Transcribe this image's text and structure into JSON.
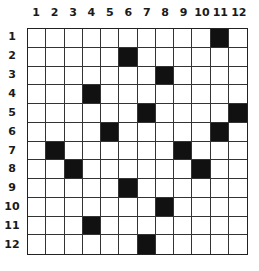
{
  "puzzle": {
    "columns": [
      "1",
      "2",
      "3",
      "4",
      "5",
      "6",
      "7",
      "8",
      "9",
      "10",
      "11",
      "12"
    ],
    "rows": [
      "1",
      "2",
      "3",
      "4",
      "5",
      "6",
      "7",
      "8",
      "9",
      "10",
      "11",
      "12"
    ],
    "filled_cells": [
      [
        1,
        11
      ],
      [
        2,
        6
      ],
      [
        3,
        8
      ],
      [
        4,
        4
      ],
      [
        5,
        7
      ],
      [
        5,
        12
      ],
      [
        6,
        5
      ],
      [
        6,
        11
      ],
      [
        7,
        2
      ],
      [
        7,
        9
      ],
      [
        8,
        3
      ],
      [
        8,
        10
      ],
      [
        9,
        6
      ],
      [
        10,
        8
      ],
      [
        11,
        4
      ],
      [
        12,
        7
      ]
    ],
    "colors": {
      "filled": "#111111",
      "empty": "#ffffff",
      "grid_line": "#333333"
    }
  }
}
